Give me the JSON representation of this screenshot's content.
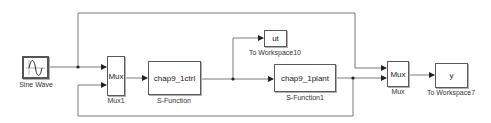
{
  "diagram": {
    "type": "simulink-model",
    "blocks": [
      {
        "id": "sine",
        "kind": "Sine Wave",
        "label": "Sine Wave"
      },
      {
        "id": "mux1",
        "kind": "Mux",
        "text": "Mux",
        "label": "Mux1"
      },
      {
        "id": "ctrl",
        "kind": "S-Function",
        "text": "chap9_1ctrl",
        "label": "S-Function"
      },
      {
        "id": "ws10",
        "kind": "To Workspace",
        "text": "ut",
        "label": "To Workspace10"
      },
      {
        "id": "plant",
        "kind": "S-Function",
        "text": "chap9_1plant",
        "label": "S-Function1"
      },
      {
        "id": "mux",
        "kind": "Mux",
        "text": "Mux",
        "label": "Mux"
      },
      {
        "id": "ws7",
        "kind": "To Workspace",
        "text": "y",
        "label": "To Workspace7"
      }
    ],
    "connections": [
      {
        "from": "sine",
        "to": "mux1",
        "port": 1
      },
      {
        "from": "sine",
        "to": "mux",
        "port": 1,
        "route": "top"
      },
      {
        "from": "mux1",
        "to": "ctrl"
      },
      {
        "from": "ctrl",
        "to": "ws10"
      },
      {
        "from": "ctrl",
        "to": "plant"
      },
      {
        "from": "plant",
        "to": "mux",
        "port": 2
      },
      {
        "from": "plant",
        "to": "mux1",
        "port": 2,
        "route": "bottom"
      },
      {
        "from": "mux",
        "to": "ws7"
      }
    ],
    "colors": {
      "line": "#6e6e6e",
      "block_border": "#5a5a5a",
      "background": "#ffffff"
    }
  }
}
